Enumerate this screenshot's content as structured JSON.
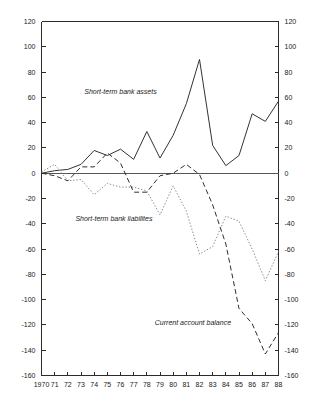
{
  "chart_data": {
    "type": "line",
    "title": "",
    "subtitle": "",
    "xlabel": "",
    "ylabel": "",
    "xlim": [
      1970,
      1988
    ],
    "ylim": [
      -160,
      120
    ],
    "ytick_step": 20,
    "grid": false,
    "legend_position": "inline-annotations",
    "left_axis_ticks": [
      "120",
      "100",
      "80",
      "60",
      "40",
      "20",
      "0",
      "-20",
      "-40",
      "-60",
      "-80",
      "-100",
      "-120",
      "-140",
      "-160"
    ],
    "right_axis_ticks": [
      "120",
      "100",
      "80",
      "60",
      "40",
      "20",
      "0",
      "-20",
      "-40",
      "-60",
      "-80",
      "-100",
      "-120",
      "-140",
      "-160"
    ],
    "ytick_values": [
      120,
      100,
      80,
      60,
      40,
      20,
      0,
      -20,
      -40,
      -60,
      -80,
      -100,
      -120,
      -140,
      -160
    ],
    "x_tick_labels": [
      "1970",
      "71",
      "72",
      "73",
      "74",
      "75",
      "76",
      "77",
      "78",
      "79",
      "80",
      "81",
      "82",
      "83",
      "84",
      "85",
      "86",
      "87",
      "88"
    ],
    "x": [
      1970,
      1971,
      1972,
      1973,
      1974,
      1975,
      1976,
      1977,
      1978,
      1979,
      1980,
      1981,
      1982,
      1983,
      1984,
      1985,
      1986,
      1987,
      1988
    ],
    "series": [
      {
        "name": "Short-term bank assets",
        "style": "solid",
        "color": "#333333",
        "label_x": 1976.0,
        "label_y": 63,
        "values": [
          0,
          2,
          3,
          7,
          18,
          14,
          19,
          11,
          33,
          12,
          30,
          55,
          90,
          22,
          6,
          14,
          47,
          41,
          57
        ]
      },
      {
        "name": "Short-term bank liabilites",
        "style": "dotted",
        "color": "#8c8c8c",
        "label_x": 1975.5,
        "label_y": -38,
        "values": [
          1,
          7,
          -6,
          -5,
          -17,
          -8,
          -11,
          -11,
          -14,
          -33,
          -10,
          -30,
          -64,
          -58,
          -34,
          -38,
          -60,
          -85,
          -62
        ]
      },
      {
        "name": "Current account balance",
        "style": "dashed",
        "color": "#2e2e2e",
        "label_x": 1981.5,
        "label_y": -120,
        "values": [
          0,
          -2,
          -6,
          5,
          5,
          16,
          8,
          -15,
          -15,
          -2,
          0,
          7,
          -1,
          -25,
          -56,
          -107,
          -119,
          -143,
          -126
        ]
      }
    ]
  }
}
